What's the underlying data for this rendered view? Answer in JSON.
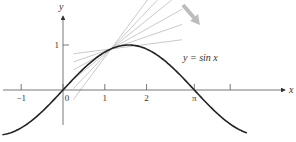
{
  "chart_data": {
    "type": "line",
    "title": "",
    "xlabel": "x",
    "ylabel": "y",
    "xlim": [
      -1.45,
      5.2
    ],
    "ylim": [
      -0.95,
      1.9
    ],
    "grid": false,
    "x_ticks": [
      {
        "value": -1,
        "label": "−1"
      },
      {
        "value": 0,
        "label": "0"
      },
      {
        "value": 1,
        "label": "1"
      },
      {
        "value": 2,
        "label": "2"
      },
      {
        "value": 3.14159,
        "label": "π"
      },
      {
        "value": 4,
        "label": ""
      }
    ],
    "y_ticks": [
      {
        "value": 1,
        "label": "1"
      }
    ],
    "series": [
      {
        "name": "y = sin x",
        "function": "sin",
        "x_range": [
          -1.45,
          4.4
        ],
        "color": "#222222"
      }
    ],
    "secant_lines": {
      "description": "Secant lines through (0,0) and points near the curve, approaching tangent",
      "color": "#bbbbbb",
      "through_x": [
        0.3,
        0.55,
        0.8,
        1.05,
        1.3,
        1.57
      ]
    },
    "annotations": [
      {
        "text": "y = sin x",
        "x": 2.7,
        "y": 0.55
      },
      {
        "type": "arrow",
        "description": "gray arrow pointing down-right",
        "color": "#bbbbbb"
      }
    ]
  }
}
